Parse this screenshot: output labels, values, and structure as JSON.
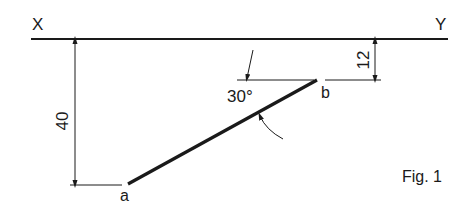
{
  "labels": {
    "x_axis": "X",
    "y_axis": "Y",
    "point_a": "a",
    "point_b": "b",
    "dim_a": "40",
    "dim_b": "12",
    "angle": "30°",
    "figure": "Fig. 1"
  },
  "colors": {
    "ink": "#1a1a1a",
    "background": "#ffffff"
  }
}
